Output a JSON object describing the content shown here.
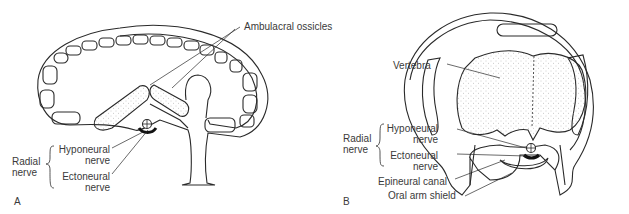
{
  "figure": {
    "panels": [
      {
        "letter": "A",
        "labels": {
          "ambulacral_ossicles": "Ambulacral ossicles",
          "radial_nerve_line1": "Radial",
          "radial_nerve_line2": "nerve",
          "hyponeural_line1": "Hyponeural",
          "hyponeural_line2": "nerve",
          "ectoneural_line1": "Ectoneural",
          "ectoneural_line2": "nerve"
        }
      },
      {
        "letter": "B",
        "labels": {
          "vertebra": "Vertebra",
          "radial_nerve_line1": "Radial",
          "radial_nerve_line2": "nerve",
          "hyponeural_line1": "Hyponeural",
          "hyponeural_line2": "nerve",
          "ectoneural_line1": "Ectoneural",
          "ectoneural_line2": "nerve",
          "epineural_canal": "Epineural canal",
          "oral_arm_shield": "Oral arm shield"
        }
      }
    ],
    "colors": {
      "line": "#2a2a2a",
      "stipple": "#9a9a9a",
      "text": "#3a3a3a"
    }
  }
}
